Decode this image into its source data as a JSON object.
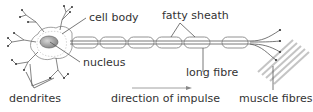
{
  "diagram": {
    "labels": {
      "cell_body": "cell body",
      "fatty_sheath": "fatty sheath",
      "nucleus": "nucleus",
      "long_fibre": "long fibre",
      "dendrites": "dendrites",
      "direction": "direction of impulse",
      "muscle_fibres": "muscle fibres"
    },
    "colors": {
      "line": "#555555",
      "nucleus_fill": "#9a9a9a",
      "muscle": "#c8c8c8",
      "text": "#333333"
    },
    "sheath_segments": 6
  }
}
